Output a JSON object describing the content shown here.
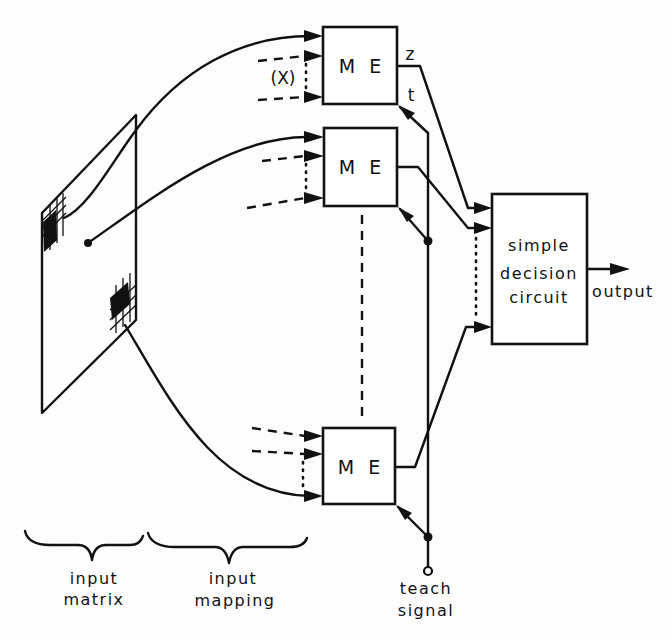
{
  "diagram": {
    "type": "block-diagram",
    "me_elements": [
      {
        "label": "M E",
        "output_label": "z",
        "teach_label": "t",
        "input_label": "(X)"
      },
      {
        "label": "M E"
      },
      {
        "label": "M E"
      }
    ],
    "decision": {
      "lines": [
        "simple",
        "decision",
        "circuit"
      ]
    },
    "output_label": "output",
    "teach": {
      "lines": [
        "teach",
        "signal"
      ]
    },
    "sections": [
      {
        "lines": [
          "input",
          "matrix"
        ]
      },
      {
        "lines": [
          "input",
          "mapping"
        ]
      }
    ],
    "edges": [
      {
        "from": "input-matrix",
        "to": "me-1"
      },
      {
        "from": "input-matrix",
        "to": "me-2"
      },
      {
        "from": "input-matrix",
        "to": "me-3"
      },
      {
        "from": "me-1",
        "to": "decision-circuit",
        "label": "z"
      },
      {
        "from": "me-2",
        "to": "decision-circuit"
      },
      {
        "from": "me-3",
        "to": "decision-circuit"
      },
      {
        "from": "teach-signal",
        "to": "me-1",
        "label": "t"
      },
      {
        "from": "teach-signal",
        "to": "me-2"
      },
      {
        "from": "teach-signal",
        "to": "me-3"
      },
      {
        "from": "decision-circuit",
        "to": "output"
      }
    ]
  }
}
